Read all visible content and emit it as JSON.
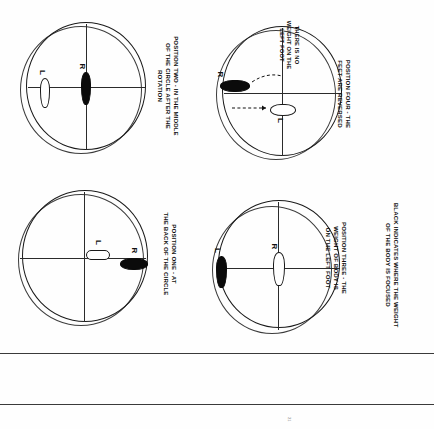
{
  "document": {
    "orientation": "rotated-90-clockwise",
    "background_color": "#fefefe",
    "ink_color": "#111111"
  },
  "legend": {
    "text": "BLACK INDICATES WHERE THE WEIGHT\nOF THE BODY IS FOCUSED"
  },
  "page_footer": {
    "page_number": "21"
  },
  "diagrams": [
    {
      "id": "position-one",
      "caption": "POSITION ONE - AT\nTHE BACK OF THE CIRCLE",
      "feet": [
        {
          "label": "L",
          "weight": "unweighted",
          "fill": "#ffffff",
          "orientation": "horizontal"
        },
        {
          "label": "R",
          "weight": "weighted",
          "fill": "#0b0b0b",
          "orientation": "horizontal"
        }
      ]
    },
    {
      "id": "position-two",
      "caption": "POSITION TWO - IN THE MIDDLE\nOF THE CIRCLE AFTER THE\nROTATION",
      "feet": [
        {
          "label": "L",
          "weight": "unweighted",
          "fill": "#ffffff",
          "orientation": "vertical"
        },
        {
          "label": "R",
          "weight": "weighted",
          "fill": "#0b0b0b",
          "orientation": "vertical"
        }
      ]
    },
    {
      "id": "position-three",
      "caption": "POSITION THREE - THE\nWEIGHT OF BODY IS\nON THE LEFT FOOT",
      "feet": [
        {
          "label": "L",
          "weight": "weighted",
          "fill": "#0b0b0b",
          "orientation": "vertical"
        },
        {
          "label": "R",
          "weight": "unweighted",
          "fill": "#ffffff",
          "orientation": "vertical"
        }
      ]
    },
    {
      "id": "position-four",
      "caption": "POSITION FOUR - THE\nFEET ARE REVERSED",
      "annotation": "THERE IS NO\nWEIGHT ON THE\nLEFT FOOT",
      "feet": [
        {
          "label": "R",
          "weight": "weighted",
          "fill": "#0b0b0b",
          "orientation": "horizontal"
        },
        {
          "label": "L",
          "weight": "unweighted",
          "fill": "#ffffff",
          "orientation": "horizontal"
        }
      ]
    }
  ]
}
